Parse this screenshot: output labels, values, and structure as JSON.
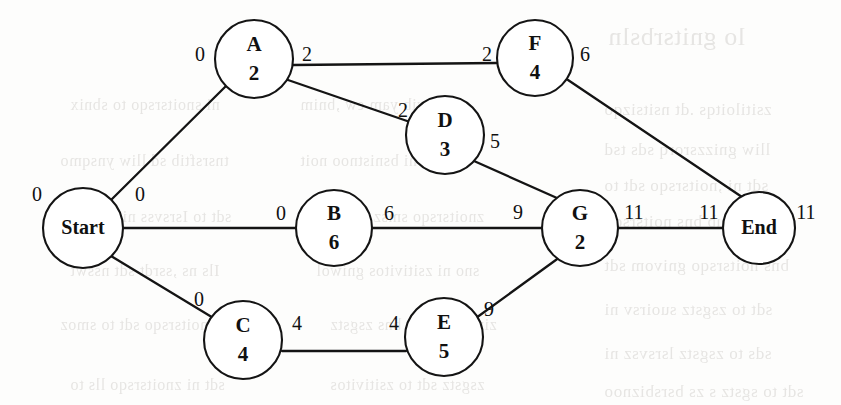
{
  "figure": {
    "kind": "activity-on-node-network",
    "width": 841,
    "height": 405,
    "background_color": "#fdfdfc",
    "ink_color": "#141414",
    "ghost_text_color": "#d9d7d4"
  },
  "nodes": [
    {
      "id": "start",
      "name": "Start",
      "duration": "",
      "cx": 83,
      "cy": 228,
      "r": 40,
      "single_label": true
    },
    {
      "id": "a",
      "name": "A",
      "duration": "2",
      "cx": 254,
      "cy": 59,
      "r": 39,
      "single_label": false
    },
    {
      "id": "b",
      "name": "B",
      "duration": "6",
      "cx": 334,
      "cy": 228,
      "r": 38,
      "single_label": false
    },
    {
      "id": "c",
      "name": "C",
      "duration": "4",
      "cx": 243,
      "cy": 340,
      "r": 39,
      "single_label": false
    },
    {
      "id": "d",
      "name": "D",
      "duration": "3",
      "cx": 445,
      "cy": 135,
      "r": 39,
      "single_label": false
    },
    {
      "id": "e",
      "name": "E",
      "duration": "5",
      "cx": 444,
      "cy": 337,
      "r": 39,
      "single_label": false
    },
    {
      "id": "f",
      "name": "F",
      "duration": "4",
      "cx": 535,
      "cy": 58,
      "r": 38,
      "single_label": false
    },
    {
      "id": "g",
      "name": "G",
      "duration": "2",
      "cx": 580,
      "cy": 228,
      "r": 38,
      "single_label": false
    },
    {
      "id": "end",
      "name": "End",
      "duration": "",
      "cx": 759,
      "cy": 228,
      "r": 36,
      "single_label": true
    }
  ],
  "edges": [
    {
      "id": "start-a",
      "from": "start",
      "to": "a",
      "x1": 111,
      "y1": 200,
      "x2": 226,
      "y2": 86
    },
    {
      "id": "start-b",
      "from": "start",
      "to": "b",
      "x1": 123,
      "y1": 228,
      "x2": 296,
      "y2": 228
    },
    {
      "id": "start-c",
      "from": "start",
      "to": "c",
      "x1": 111,
      "y1": 256,
      "x2": 215,
      "y2": 319
    },
    {
      "id": "a-f",
      "from": "a",
      "to": "f",
      "x1": 293,
      "y1": 65,
      "x2": 497,
      "y2": 63
    },
    {
      "id": "a-d",
      "from": "a",
      "to": "d",
      "x1": 288,
      "y1": 80,
      "x2": 410,
      "y2": 122
    },
    {
      "id": "b-g",
      "from": "b",
      "to": "g",
      "x1": 372,
      "y1": 228,
      "x2": 542,
      "y2": 228
    },
    {
      "id": "c-e",
      "from": "c",
      "to": "e",
      "x1": 282,
      "y1": 351,
      "x2": 406,
      "y2": 351
    },
    {
      "id": "d-g",
      "from": "d",
      "to": "g",
      "x1": 474,
      "y1": 161,
      "x2": 557,
      "y2": 198
    },
    {
      "id": "e-g",
      "from": "e",
      "to": "g",
      "x1": 476,
      "y1": 318,
      "x2": 560,
      "y2": 257
    },
    {
      "id": "f-end",
      "from": "f",
      "to": "end",
      "x1": 568,
      "y1": 80,
      "x2": 742,
      "y2": 197
    },
    {
      "id": "g-end",
      "from": "g",
      "to": "end",
      "x1": 618,
      "y1": 228,
      "x2": 723,
      "y2": 228
    }
  ],
  "edge_labels": [
    {
      "id": "lbl-start-es",
      "text": "0",
      "x": 37,
      "y": 196,
      "meaning": "early-start-of-Start"
    },
    {
      "id": "lbl-start-ef",
      "text": "0",
      "x": 140,
      "y": 196,
      "meaning": "early-finish-of-Start"
    },
    {
      "id": "lbl-a-es",
      "text": "0",
      "x": 200,
      "y": 56,
      "meaning": "early-start-of-A"
    },
    {
      "id": "lbl-a-ef",
      "text": "2",
      "x": 307,
      "y": 56,
      "meaning": "early-finish-of-A"
    },
    {
      "id": "lbl-b-es",
      "text": "0",
      "x": 281,
      "y": 215,
      "meaning": "early-start-of-B"
    },
    {
      "id": "lbl-b-ef",
      "text": "6",
      "x": 389,
      "y": 215,
      "meaning": "early-finish-of-B"
    },
    {
      "id": "lbl-c-es",
      "text": "0",
      "x": 199,
      "y": 301,
      "meaning": "early-start-of-C"
    },
    {
      "id": "lbl-c-ef",
      "text": "4",
      "x": 297,
      "y": 325,
      "meaning": "early-finish-of-C"
    },
    {
      "id": "lbl-d-es",
      "text": "2",
      "x": 403,
      "y": 112,
      "meaning": "early-start-of-D"
    },
    {
      "id": "lbl-d-ef",
      "text": "5",
      "x": 495,
      "y": 143,
      "meaning": "early-finish-of-D"
    },
    {
      "id": "lbl-e-es",
      "text": "4",
      "x": 394,
      "y": 325,
      "meaning": "early-start-of-E"
    },
    {
      "id": "lbl-e-ef",
      "text": "9",
      "x": 489,
      "y": 311,
      "meaning": "early-finish-of-E"
    },
    {
      "id": "lbl-f-es",
      "text": "2",
      "x": 487,
      "y": 56,
      "meaning": "early-start-of-F"
    },
    {
      "id": "lbl-f-ef",
      "text": "6",
      "x": 585,
      "y": 56,
      "meaning": "early-finish-of-F"
    },
    {
      "id": "lbl-g-es",
      "text": "9",
      "x": 518,
      "y": 214,
      "meaning": "early-start-of-G"
    },
    {
      "id": "lbl-g-ef",
      "text": "11",
      "x": 634,
      "y": 214,
      "meaning": "early-finish-of-G"
    },
    {
      "id": "lbl-end-es",
      "text": "11",
      "x": 709,
      "y": 214,
      "meaning": "early-start-of-End"
    },
    {
      "id": "lbl-end-ef",
      "text": "11",
      "x": 806,
      "y": 214,
      "meaning": "early-finish-of-End"
    }
  ],
  "ghost_text": [
    {
      "id": "g1",
      "text": "lo gnitsrbsln",
      "x": 608,
      "y": 22,
      "size": 26
    },
    {
      "id": "g2",
      "text": "ni  snoitsrsqo  to  sbnix",
      "x": 70,
      "y": 96,
      "size": 16
    },
    {
      "id": "g3",
      "text": "ew  sbivib  yam  ew  ,bnim",
      "x": 300,
      "y": 96,
      "size": 16
    },
    {
      "id": "g4",
      "text": "zsitiloitqs  .dt  nsitsizqo",
      "x": 604,
      "y": 100,
      "size": 17
    },
    {
      "id": "g5",
      "text": "lliw  gnizzsrorq  sds  tsd",
      "x": 604,
      "y": 140,
      "size": 17
    },
    {
      "id": "g6",
      "text": "tnsrsftib  sd  lliw  ynsqmo",
      "x": 60,
      "y": 152,
      "size": 16
    },
    {
      "id": "g7",
      "text": "ztnsvs  ni  bsnistnoo  noit",
      "x": 300,
      "y": 152,
      "size": 16
    },
    {
      "id": "g8",
      "text": "sdt  ni  ,noitsrsqo  sdt  to",
      "x": 604,
      "y": 176,
      "size": 17
    },
    {
      "id": "g9",
      "text": "sdt  to  Isrsvss  ni  sldsli",
      "x": 80,
      "y": 208,
      "size": 16
    },
    {
      "id": "g10",
      "text": "znoitsrsqo  smsz  sdt  ni",
      "x": 330,
      "y": 208,
      "size": 16
    },
    {
      "id": "g11",
      "text": "sdt  gnirub  bns  noitsrsqo",
      "x": 604,
      "y": 212,
      "size": 17
    },
    {
      "id": "g12",
      "text": "Ils  ns  ,ssrdt  sdt  nsswt",
      "x": 70,
      "y": 262,
      "size": 16
    },
    {
      "id": "g13",
      "text": "sno  ni  zsitivitos  gniwol",
      "x": 316,
      "y": 262,
      "size": 16
    },
    {
      "id": "g14",
      "text": "bns  noitsrsqo  gnivom  sdt",
      "x": 604,
      "y": 256,
      "size": 17
    },
    {
      "id": "g15",
      "text": "sdt  to  zsgstz  suoirsv  ni",
      "x": 604,
      "y": 300,
      "size": 17
    },
    {
      "id": "g16",
      "text": "snoitsrsqo  sdt  to  smoz",
      "x": 60,
      "y": 316,
      "size": 16
    },
    {
      "id": "g17",
      "text": "zinsmsgnsrrs  bns  zsgstz",
      "x": 330,
      "y": 316,
      "size": 16
    },
    {
      "id": "g18",
      "text": "sds  to  zsgstz  lsrsvsz  ni",
      "x": 604,
      "y": 344,
      "size": 17
    },
    {
      "id": "g19",
      "text": "sdt  ni  znoitsrsqo  lls  to",
      "x": 70,
      "y": 376,
      "size": 16
    },
    {
      "id": "g20",
      "text": "zsgstz  sdt  to  zsitivitos",
      "x": 330,
      "y": 376,
      "size": 16
    },
    {
      "id": "g21",
      "text": "sdt  to  sgstz  s  zs  bsrsbiznoo",
      "x": 604,
      "y": 382,
      "size": 17
    }
  ]
}
